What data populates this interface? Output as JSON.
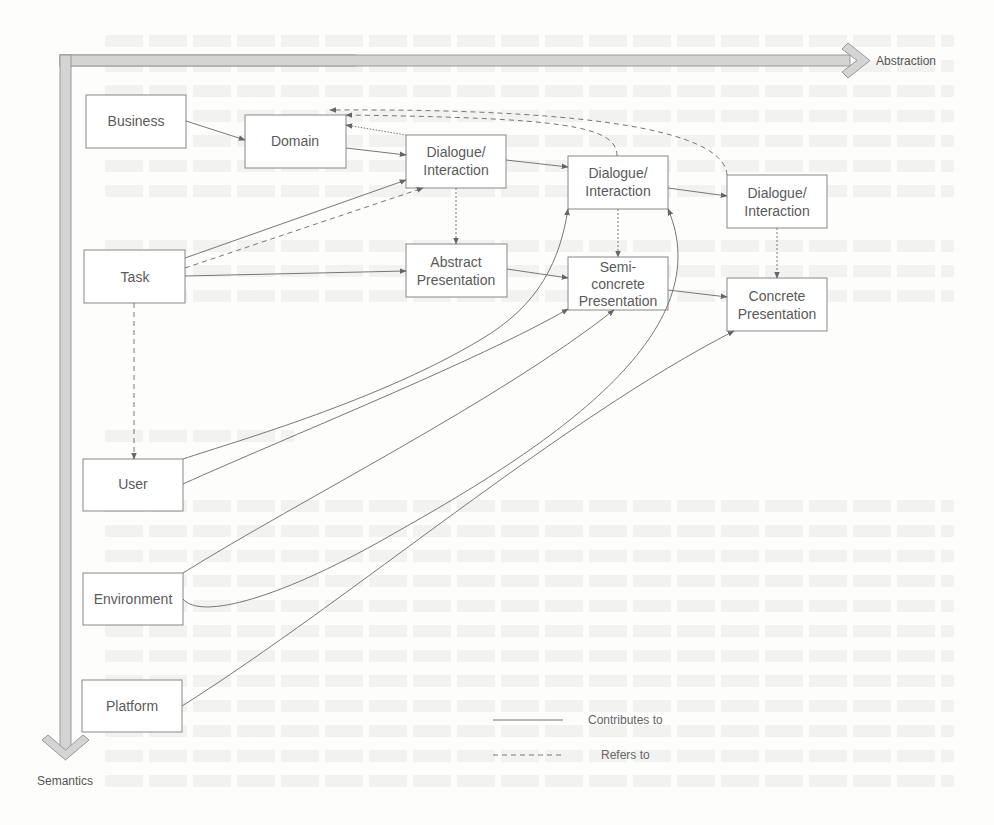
{
  "axes": {
    "horizontal": "Abstraction",
    "vertical": "Semantics"
  },
  "nodes": {
    "business": [
      "Business"
    ],
    "domain": [
      "Domain"
    ],
    "task": [
      "Task"
    ],
    "user": [
      "User"
    ],
    "environment": [
      "Environment"
    ],
    "platform": [
      "Platform"
    ],
    "dialogue1": [
      "Dialogue/",
      "Interaction"
    ],
    "dialogue2": [
      "Dialogue/",
      "Interaction"
    ],
    "dialogue3": [
      "Dialogue/",
      "Interaction"
    ],
    "abstract_presentation": [
      "Abstract",
      "Presentation"
    ],
    "semiconcrete_presentation": [
      "Semi-",
      "concrete",
      "Presentation"
    ],
    "concrete_presentation": [
      "Concrete",
      "Presentation"
    ]
  },
  "legend": {
    "solid": "Contributes to",
    "dashed": "Refers to"
  },
  "colors": {
    "stroke": "#777777",
    "axis_fill": "#d4d4d4",
    "text": "#5a5a5a"
  }
}
